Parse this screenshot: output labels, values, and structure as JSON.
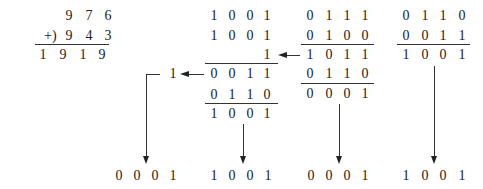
{
  "decimal": {
    "operator": "+)",
    "addend1": [
      "9",
      "7",
      "6"
    ],
    "addend2": [
      "9",
      "4",
      "3"
    ],
    "sum": [
      "1",
      "9",
      "1",
      "9"
    ]
  },
  "digit_group_hundreds": {
    "addend1": [
      "1",
      "0",
      "0",
      "1"
    ],
    "addend2": [
      "1",
      "0",
      "0",
      "1"
    ],
    "carry_in": "1",
    "partial": [
      "0",
      "0",
      "1",
      "1"
    ],
    "carry_out": "1",
    "correction": [
      "0",
      "1",
      "1",
      "0"
    ],
    "result": [
      "1",
      "0",
      "0",
      "1"
    ]
  },
  "digit_group_tens": {
    "addend1": [
      "0",
      "1",
      "1",
      "1"
    ],
    "addend2": [
      "0",
      "1",
      "0",
      "0"
    ],
    "sum": [
      "1",
      "0",
      "1",
      "1"
    ],
    "correction": [
      "0",
      "1",
      "1",
      "0"
    ],
    "result": [
      "0",
      "0",
      "0",
      "1"
    ]
  },
  "digit_group_units": {
    "addend1": [
      "0",
      "1",
      "1",
      "0"
    ],
    "addend2": [
      "0",
      "0",
      "1",
      "1"
    ],
    "result": [
      "1",
      "0",
      "0",
      "1"
    ]
  },
  "final_bcd": [
    [
      "0",
      "0",
      "0",
      "1"
    ],
    [
      "1",
      "0",
      "0",
      "1"
    ],
    [
      "0",
      "0",
      "0",
      "1"
    ],
    [
      "1",
      "0",
      "0",
      "1"
    ]
  ]
}
